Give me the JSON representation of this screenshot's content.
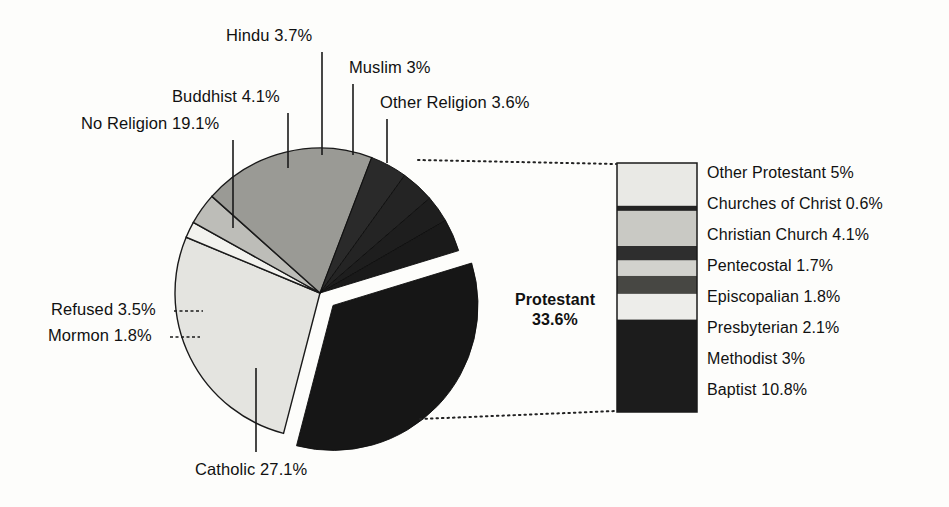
{
  "figure": {
    "background": "#fdfdfb",
    "stroke": "#1a1a1a"
  },
  "chart_data": {
    "type": "pie",
    "title": "",
    "subtitle": "",
    "xlabel": "",
    "ylabel": "",
    "grid": false,
    "legend_position": "right-of-bar",
    "units": "percent",
    "exploded_slice": "Protestant",
    "categories": [
      "Protestant",
      "Catholic",
      "Mormon",
      "Refused",
      "No Religion",
      "Buddhist",
      "Hindu",
      "Muslim",
      "Other Religion"
    ],
    "values": [
      33.6,
      27.1,
      1.8,
      3.5,
      19.1,
      4.1,
      3.7,
      3.0,
      3.6
    ],
    "labels": [
      "Protestant 33.6%",
      "Catholic 27.1%",
      "Mormon 1.8%",
      "Refused 3.5%",
      "No Religion 19.1%",
      "Buddhist 4.1%",
      "Hindu 3.7%",
      "Muslim 3%",
      "Other Religion 3.6%"
    ],
    "slice_fills": [
      "#161616",
      "#e4e4e0",
      "#f2f2ee",
      "#bdbdb8",
      "#9a9a95",
      "#2a2a2a",
      "#242424",
      "#1e1e1e",
      "#1a1a1a"
    ],
    "breakout": {
      "type": "bar",
      "orientation": "stacked-vertical",
      "parent": "Protestant",
      "parent_total": 33.6,
      "categories": [
        "Other Protestant",
        "Churches of Christ",
        "Christian Church",
        "Pentecostal",
        "Episcopalian",
        "Presbyterian",
        "Methodist",
        "Baptist"
      ],
      "values": [
        5.0,
        0.6,
        4.1,
        1.7,
        1.8,
        2.1,
        3.0,
        10.8
      ],
      "labels": [
        "Other Protestant 5%",
        "Churches of Christ 0.6%",
        "Christian Church 4.1%",
        "Pentecostal 1.7%",
        "Episcopalian 1.8%",
        "Presbyterian 2.1%",
        "Methodist 3%",
        "Baptist 10.8%"
      ],
      "segment_fills": [
        "#e9e9e5",
        "#232323",
        "#c9c9c4",
        "#2e2e2e",
        "#d2d2cd",
        "#474743",
        "#ededea",
        "#1c1c1c"
      ]
    }
  },
  "pie_labels": {
    "no_religion": "No Religion 19.1%",
    "buddhist": "Buddhist 4.1%",
    "hindu": "Hindu 3.7%",
    "muslim": "Muslim 3%",
    "other_religion": "Other Religion 3.6%",
    "refused": "Refused 3.5%",
    "mormon": "Mormon 1.8%",
    "catholic": "Catholic 27.1%",
    "protestant_name": "Protestant",
    "protestant_value": "33.6%"
  },
  "legend": {
    "items": [
      "Other Protestant 5%",
      "Churches of Christ 0.6%",
      "Christian Church 4.1%",
      "Pentecostal 1.7%",
      "Episcopalian 1.8%",
      "Presbyterian 2.1%",
      "Methodist 3%",
      "Baptist 10.8%"
    ]
  }
}
